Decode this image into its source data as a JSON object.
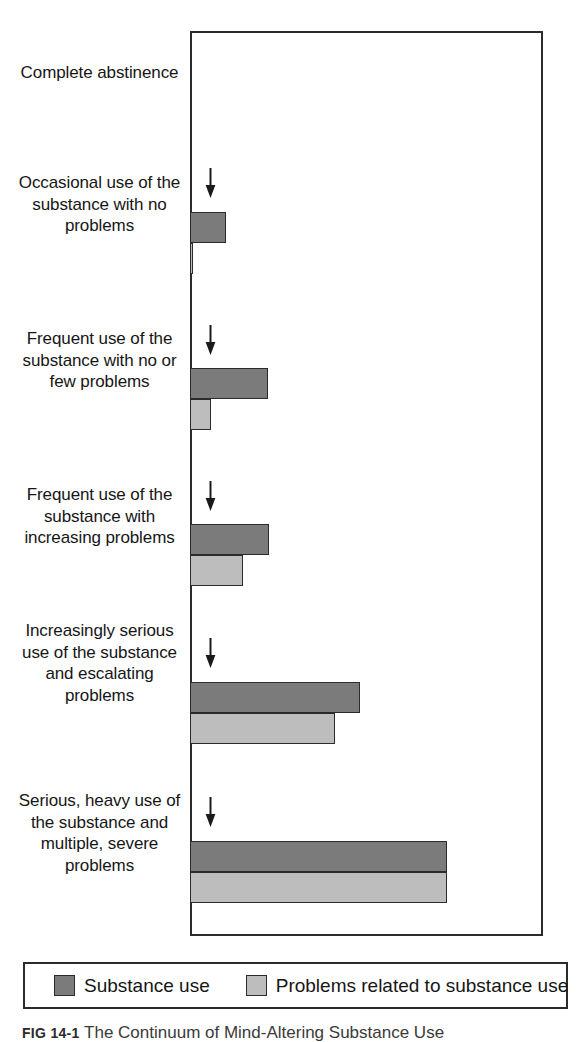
{
  "figure": {
    "caption_number": "FIG 14-1",
    "caption_text": "The Continuum of Mind-Altering Substance Use"
  },
  "legend": {
    "items": [
      {
        "label": "Substance use",
        "color": "#7b7b7b",
        "swatch": "dark-swatch"
      },
      {
        "label": "Problems related to substance use",
        "color": "#bdbdbd",
        "swatch": "light-swatch"
      }
    ]
  },
  "chart_data": {
    "type": "bar",
    "orientation": "horizontal",
    "title": "The Continuum of Mind-Altering Substance Use",
    "xlabel": "",
    "ylabel": "",
    "grid": false,
    "axis_ticks": false,
    "legend_position": "bottom",
    "xlim": [
      0,
      100
    ],
    "categories": [
      "Complete abstinence",
      "Occasional use of the substance with no problems",
      "Frequent use of the substance with no or few problems",
      "Frequent use of the substance with increasing problems",
      "Increasingly serious use of the substance and escalating problems",
      "Serious, heavy use of the substance and multiple, severe problems"
    ],
    "series": [
      {
        "name": "Substance use",
        "color": "#7b7b7b",
        "values": [
          0,
          10,
          22,
          22,
          48,
          73
        ]
      },
      {
        "name": "Problems related to substance use",
        "color": "#bdbdbd",
        "values": [
          0,
          1,
          6,
          15,
          41,
          73
        ]
      }
    ],
    "annotations": [
      {
        "type": "down-arrow",
        "category_index": 1
      },
      {
        "type": "down-arrow",
        "category_index": 2
      },
      {
        "type": "down-arrow",
        "category_index": 3
      },
      {
        "type": "down-arrow",
        "category_index": 4
      },
      {
        "type": "down-arrow",
        "category_index": 5
      }
    ]
  },
  "layout": {
    "plot_left_px": 190,
    "plot_right_px": 543,
    "plot_top_px": 31,
    "plot_bottom_px": 936,
    "bar_px": [
      {
        "dark": 0,
        "light": 0,
        "dark_top": 59,
        "light_top": 90,
        "h": 31,
        "label_top": 62,
        "arrow_top": 0,
        "arrow_show": false
      },
      {
        "dark": 36,
        "light": 3,
        "dark_top": 212,
        "light_top": 243,
        "h": 31,
        "label_top": 172,
        "arrow_top": 168,
        "arrow_show": true
      },
      {
        "dark": 78,
        "light": 21,
        "dark_top": 368,
        "light_top": 399,
        "h": 31,
        "label_top": 328,
        "arrow_top": 325,
        "arrow_show": true
      },
      {
        "dark": 79,
        "light": 53,
        "dark_top": 524,
        "light_top": 555,
        "h": 31,
        "label_top": 484,
        "arrow_top": 481,
        "arrow_show": true
      },
      {
        "dark": 170,
        "light": 145,
        "dark_top": 682,
        "light_top": 713,
        "h": 31,
        "label_top": 620,
        "arrow_top": 638,
        "arrow_show": true
      },
      {
        "dark": 257,
        "light": 257,
        "dark_top": 841,
        "light_top": 872,
        "h": 31,
        "label_top": 790,
        "arrow_top": 797,
        "arrow_show": true
      }
    ]
  }
}
